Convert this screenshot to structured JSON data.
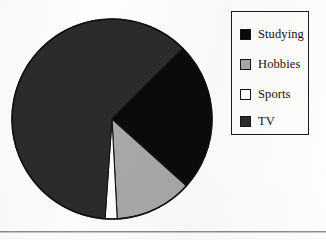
{
  "chart_data": {
    "type": "pie",
    "title": "",
    "subtitle": "",
    "xlabel": "",
    "ylabel": "",
    "grid": false,
    "legend_position": "right",
    "categories": [
      "Studying",
      "Hobbies",
      "Sports",
      "TV"
    ],
    "values": [
      24,
      12.5,
      2,
      61.5
    ],
    "units": "percent",
    "slices": [
      {
        "label": "Studying",
        "value": 24,
        "color": "#0b0b0b",
        "start_angle_deg": 45,
        "end_angle_deg": -42
      },
      {
        "label": "Hobbies",
        "value": 12.5,
        "color": "#a8a8a8",
        "start_angle_deg": -42,
        "end_angle_deg": -87
      },
      {
        "label": "Sports",
        "value": 2,
        "color": "#ffffff",
        "start_angle_deg": -87,
        "end_angle_deg": -94
      },
      {
        "label": "TV",
        "value": 61.5,
        "color": "#2b2b2b",
        "start_angle_deg": -94,
        "end_angle_deg": -315
      }
    ],
    "start_angle_deg": 45,
    "direction": "clockwise",
    "outline_color": "#111111",
    "background": "#fdfdfc"
  },
  "legend": {
    "items": [
      {
        "label": "Studying",
        "swatch_color": "#0b0b0b",
        "swatch_icon": "filled-square-icon"
      },
      {
        "label": "Hobbies",
        "swatch_color": "#a8a8a8",
        "swatch_icon": "filled-square-icon"
      },
      {
        "label": "Sports",
        "swatch_color": "#ffffff",
        "swatch_icon": "empty-square-icon"
      },
      {
        "label": "TV",
        "swatch_color": "#2b2b2b",
        "swatch_icon": "filled-square-icon"
      }
    ]
  }
}
